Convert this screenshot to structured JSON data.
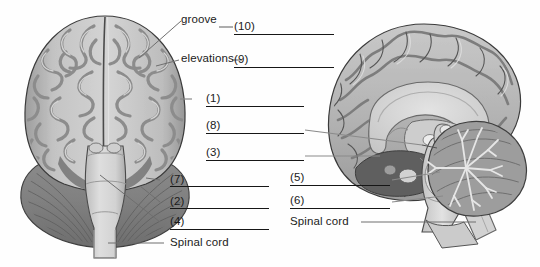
{
  "figure": {
    "views": [
      {
        "name": "anterior-coronal-brain-view",
        "side": "left"
      },
      {
        "name": "midsagittal-brain-view",
        "side": "right"
      }
    ]
  },
  "labels": {
    "groove": "groove",
    "elevations": "elevations",
    "n10": "(10)",
    "n9": "(9)",
    "n1": "(1)",
    "n8": "(8)",
    "n3": "(3)",
    "n7": "(7)",
    "n2": "(2)",
    "n4": "(4)",
    "n5": "(5)",
    "n6": "(6)",
    "spinal_cord_left": "Spinal cord",
    "spinal_cord_right": "Spinal cord"
  },
  "colors": {
    "ink": "#161616",
    "leader": "#6f6f6f",
    "cortex_light": "#d2d2d2",
    "cortex_mid": "#b4b4b4",
    "cortex_dark": "#8e8e8e",
    "cerebellum": "#8a8a8a",
    "brainstem": "#d8d8d8",
    "deep_dark": "#5e5e5e",
    "outline": "#3b3b3b",
    "background": "#ffffff"
  }
}
